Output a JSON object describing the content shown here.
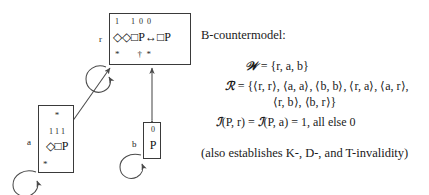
{
  "figure": {
    "type": "modal-logic-countermodel-diagram",
    "title": "B-countermodel:"
  },
  "worlds": [
    {
      "id": "r",
      "label": "r",
      "values": "1      1  0  0",
      "formula": "◇◇□P↔□P",
      "marks": "*        †  *"
    },
    {
      "id": "a",
      "label": "a",
      "top_mark": "*",
      "values": "1 1 1",
      "formula": "◇□P",
      "bottom_mark": "*"
    },
    {
      "id": "b",
      "label": "b",
      "values": "0",
      "formula": "P"
    }
  ],
  "arrows": [
    {
      "name": "self-loop-r",
      "from": "r",
      "to": "r"
    },
    {
      "name": "self-loop-a",
      "from": "a",
      "to": "a"
    },
    {
      "name": "self-loop-b",
      "from": "b",
      "to": "b"
    },
    {
      "name": "bidirectional-r-a",
      "from": "r",
      "to": "a"
    },
    {
      "name": "bidirectional-r-b",
      "from": "r",
      "to": "b"
    }
  ],
  "model": {
    "worlds_line": "ℰ = {r, a, b}",
    "worlds_symbol": "𝒲",
    "worlds_value": " = {r, a, b}",
    "relation_symbol": "ℛ",
    "relation_line_1": " = {⟨r, r⟩, ⟨a, a⟩, ⟨b, b⟩, ⟨r, a⟩, ⟨a, r⟩,",
    "relation_line_2": "⟨r, b⟩, ⟨b, r⟩}",
    "interpretation_symbol_1": "ℐ",
    "interpretation_part_1": "(P, r) = ",
    "interpretation_symbol_2": "ℐ",
    "interpretation_part_2": "(P, a) = 1, all else 0",
    "note": "(also establishes K-, D-, and T-invalidity)"
  },
  "colors": {
    "ink": "#1a1a1a",
    "box_border": "#3a3a3a",
    "arrow": "#4a4a4a",
    "background": "#ffffff"
  }
}
